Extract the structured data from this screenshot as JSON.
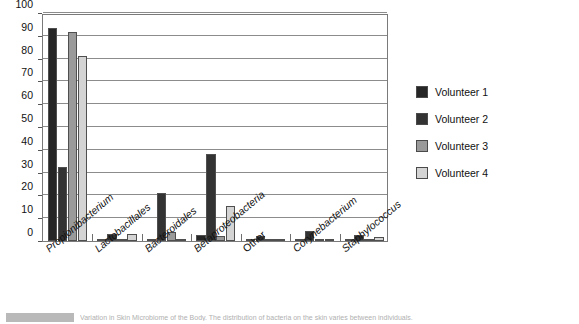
{
  "chart_data": {
    "type": "bar",
    "title": "",
    "xlabel": "",
    "ylabel": "",
    "ylim": [
      0,
      100
    ],
    "ytick_step": 10,
    "yticks": [
      100,
      90,
      80,
      70,
      60,
      50,
      40,
      30,
      20,
      10,
      0
    ],
    "grid": true,
    "legend_position": "right",
    "categories": [
      "Propionibacterium",
      "Lactobacillales",
      "Bacteroidales",
      "Betaproteobacteria",
      "Other",
      "Corynebacterium",
      "Staphylococcus"
    ],
    "category_styles": [
      "italic",
      "italic",
      "italic",
      "italic",
      "plain",
      "italic",
      "italic"
    ],
    "series": [
      {
        "name": "Volunteer 1",
        "color": "#262626",
        "values": [
          93.5,
          1.0,
          1.0,
          2.5,
          1.0,
          0.6,
          1.0
        ]
      },
      {
        "name": "Volunteer 2",
        "color": "#333333",
        "values": [
          32.5,
          3.0,
          21.0,
          38.0,
          2.0,
          4.5,
          2.8
        ]
      },
      {
        "name": "Volunteer 3",
        "color": "#9a9a9a",
        "values": [
          91.5,
          0.6,
          4.0,
          2.0,
          1.0,
          0.3,
          1.0
        ]
      },
      {
        "name": "Volunteer 4",
        "color": "#d4d4d4",
        "values": [
          81.0,
          3.0,
          0.8,
          15.5,
          0.4,
          0.2,
          1.6
        ]
      }
    ]
  },
  "legend": {
    "items": [
      {
        "label": "Volunteer 1",
        "color": "#262626"
      },
      {
        "label": "Volunteer 2",
        "color": "#333333"
      },
      {
        "label": "Volunteer 3",
        "color": "#9a9a9a"
      },
      {
        "label": "Volunteer 4",
        "color": "#d4d4d4"
      }
    ]
  },
  "caption": {
    "text": "Variation in Skin Microbiome of the Body. The distribution of bacteria on the skin varies between individuals."
  }
}
